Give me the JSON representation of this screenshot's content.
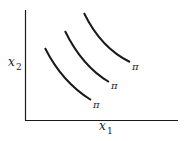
{
  "diagram": {
    "type": "isoprofit-curves",
    "y_axis_label": "x",
    "y_axis_subscript": "2",
    "x_axis_label": "x",
    "x_axis_subscript": "1",
    "curves": [
      {
        "label": "π"
      },
      {
        "label": "π"
      },
      {
        "label": "π"
      }
    ],
    "colors": {
      "line": "#1a1a1a",
      "background": "#ffffff"
    }
  }
}
